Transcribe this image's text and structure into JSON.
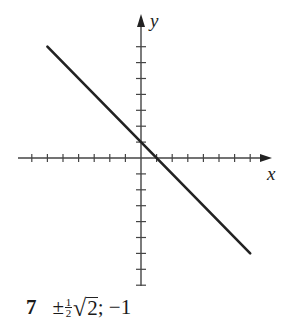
{
  "figure": {
    "x_axis_label": "x",
    "y_axis_label": "y",
    "line_color": "#222222",
    "axis_color": "#444444"
  },
  "chart_data": {
    "type": "line",
    "title": "",
    "xlabel": "x",
    "ylabel": "y",
    "xlim": [
      -7,
      8
    ],
    "ylim": [
      -8,
      7
    ],
    "grid": false,
    "x_ticks": [
      -7,
      -6,
      -5,
      -4,
      -3,
      -2,
      -1,
      1,
      2,
      3,
      4,
      5,
      6,
      7
    ],
    "y_ticks": [
      -8,
      -7,
      -6,
      -5,
      -4,
      -3,
      -2,
      -1,
      1,
      2,
      3,
      4,
      5,
      6,
      7
    ],
    "series": [
      {
        "name": "y = 1 - x",
        "x": [
          -6,
          7
        ],
        "y": [
          7,
          -6
        ]
      }
    ]
  },
  "caption": {
    "number": "7",
    "pm": "±",
    "frac_num": "1",
    "frac_den": "2",
    "radical": "√",
    "radicand": "2",
    "rest": "; −1"
  }
}
